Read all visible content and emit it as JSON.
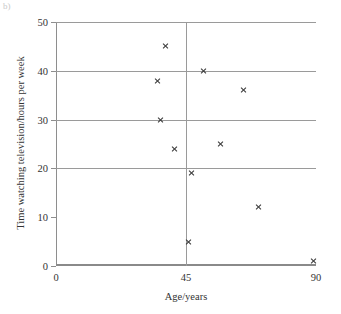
{
  "part_label": "b)",
  "chart_data": {
    "type": "scatter",
    "title": "",
    "xlabel": "Age/years",
    "ylabel": "Time watching television/hours per week",
    "xlim": [
      0,
      90
    ],
    "ylim": [
      0,
      50
    ],
    "xticks": [
      0,
      45,
      90
    ],
    "yticks": [
      0,
      10,
      20,
      30,
      40,
      50
    ],
    "xtick_labels": [
      "0",
      "45",
      "90"
    ],
    "ytick_labels": [
      "0",
      "10",
      "20",
      "30",
      "40",
      "50"
    ],
    "grid": "horizontal gridlines at 20, 30, 40, 50 and one vertical gridline at x=45",
    "hgridlines": [
      20,
      30,
      40,
      50
    ],
    "vgridlines": [
      45
    ],
    "legend": "none",
    "marker": "x",
    "series": [
      {
        "name": "Television viewing by age",
        "points": [
          {
            "x": 38,
            "y": 45
          },
          {
            "x": 35,
            "y": 38
          },
          {
            "x": 36,
            "y": 30
          },
          {
            "x": 41,
            "y": 24
          },
          {
            "x": 51,
            "y": 40
          },
          {
            "x": 65,
            "y": 36
          },
          {
            "x": 57,
            "y": 25
          },
          {
            "x": 47,
            "y": 19
          },
          {
            "x": 70,
            "y": 12
          },
          {
            "x": 46,
            "y": 5
          },
          {
            "x": 89,
            "y": 1
          }
        ]
      }
    ]
  }
}
